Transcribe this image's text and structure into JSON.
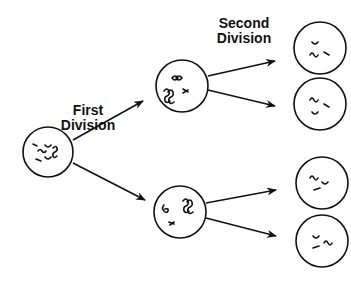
{
  "labels": {
    "first_division": [
      "First",
      "Division"
    ],
    "second_division": [
      "Second",
      "Division"
    ]
  },
  "cells": {
    "parent": {
      "cx": 48,
      "cy": 152,
      "r": 25
    },
    "meiosis_one_top": {
      "cx": 182,
      "cy": 86,
      "r": 26
    },
    "meiosis_one_bottom": {
      "cx": 180,
      "cy": 212,
      "r": 26
    },
    "daughter_1": {
      "cx": 320,
      "cy": 48,
      "r": 26
    },
    "daughter_2": {
      "cx": 320,
      "cy": 104,
      "r": 26
    },
    "daughter_3": {
      "cx": 322,
      "cy": 183,
      "r": 26
    },
    "daughter_4": {
      "cx": 322,
      "cy": 241,
      "r": 26
    }
  },
  "colors": {
    "stroke": "#111111",
    "background": "#ffffff"
  }
}
